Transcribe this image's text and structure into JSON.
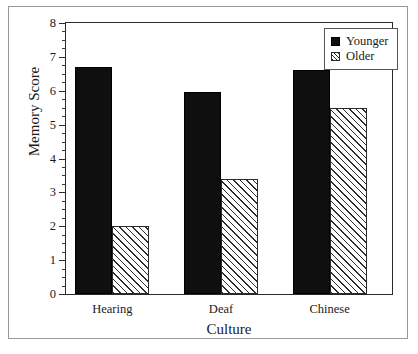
{
  "chart_data": {
    "type": "bar",
    "title": "",
    "xlabel": "Culture",
    "ylabel": "Memory Score",
    "categories": [
      "Hearing",
      "Deaf",
      "Chinese"
    ],
    "series": [
      {
        "name": "Younger",
        "values": [
          6.7,
          5.95,
          6.6
        ],
        "color": "#100f0f",
        "fill": "solid"
      },
      {
        "name": "Older",
        "values": [
          2.0,
          3.4,
          5.5
        ],
        "color": "#2d2d2d",
        "fill": "diagonal-hatch"
      }
    ],
    "ylim": [
      0,
      8
    ],
    "ytick_labels": [
      "0",
      "1",
      "2",
      "3",
      "4",
      "5",
      "6",
      "7",
      "8"
    ],
    "ytick_values": [
      0,
      1,
      2,
      3,
      4,
      5,
      6,
      7,
      8
    ],
    "yminor_interval": 0.25,
    "grid": false,
    "legend_position": "top-right",
    "legend_entries": [
      "Younger",
      "Older"
    ]
  },
  "legend": {
    "entries": [
      {
        "label": "Younger",
        "marker": "filled-square-icon"
      },
      {
        "label": "Older",
        "marker": "hatched-square-icon"
      }
    ]
  },
  "axes": {
    "x_title": "Culture",
    "y_title": "Memory Score"
  }
}
